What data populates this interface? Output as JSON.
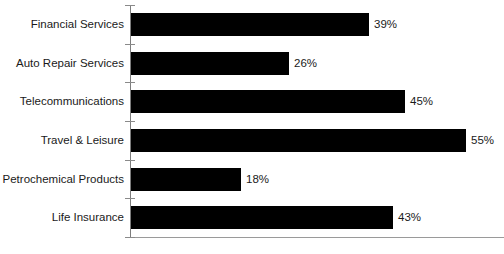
{
  "chart_data": {
    "type": "bar",
    "orientation": "horizontal",
    "title": "",
    "subtitle": "",
    "xlabel": "",
    "ylabel": "",
    "xlim": [
      0,
      61
    ],
    "grid": false,
    "legend": null,
    "value_suffix": "%",
    "bar_color": "#000000",
    "axis_color": "#8a8a8a",
    "text_color": "#1a1a1a",
    "categories": [
      "Financial Services",
      "Auto Repair Services",
      "Telecommunications",
      "Travel & Leisure",
      "Petrochemical Products",
      "Life Insurance"
    ],
    "values": [
      39,
      26,
      45,
      55,
      18,
      43
    ],
    "labels": [
      "39%",
      "26%",
      "45%",
      "55%",
      "18%",
      "43%"
    ]
  }
}
